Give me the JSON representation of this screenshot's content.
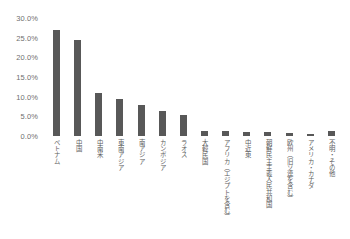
{
  "chart_data": {
    "type": "bar",
    "title": "",
    "xlabel": "",
    "ylabel": "",
    "ylim": [
      0,
      30
    ],
    "grid": false,
    "legend": null,
    "bar_color": "#585858",
    "axis_text_color": "#6f6f6f",
    "ytick_labels": [
      "30.0%",
      "25.0%",
      "20.0%",
      "15.0%",
      "10.0%",
      "5.0%",
      "0.0%"
    ],
    "ytick_values": [
      30,
      25,
      20,
      15,
      10,
      5,
      0
    ],
    "categories": [
      "ベトナム",
      "中国",
      "中南米",
      "東南アジア",
      "南アジア",
      "カンボジア",
      "ラオス",
      "大韓民国",
      "アフリカ（エジプトを含む）",
      "中近東",
      "朝鮮民主主義人民共和国",
      "欧州（旧ソ連を含む）",
      "アメリカ・カナダ",
      "不明・その他"
    ],
    "values": [
      27.0,
      24.5,
      11.0,
      9.5,
      8.0,
      6.3,
      5.3,
      1.4,
      1.2,
      1.1,
      0.9,
      0.7,
      0.6,
      1.3
    ]
  }
}
